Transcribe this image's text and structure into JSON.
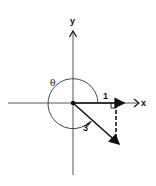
{
  "diagram": {
    "type": "vector-angle-diagram",
    "axes": {
      "x_label": "x",
      "y_label": "y"
    },
    "labels": {
      "angle": "θ",
      "unit_vector_length": "1",
      "arc_label": "3"
    },
    "colors": {
      "stroke": "#111111",
      "background": "#ffffff"
    }
  }
}
